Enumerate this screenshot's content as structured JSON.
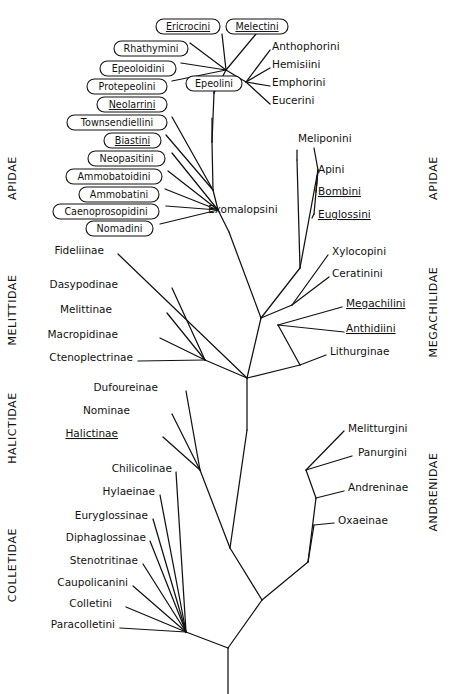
{
  "figure": {
    "type": "phylogenetic-cladogram",
    "background_color": "#ffffff",
    "line_color": "#111111"
  },
  "families": [
    {
      "id": "apidae",
      "label": "APIDAE",
      "side": "left",
      "x": 16,
      "y": 178,
      "rotate": -90
    },
    {
      "id": "apidae_right",
      "label": "APIDAE",
      "side": "right",
      "x": 437,
      "y": 178,
      "rotate": -90
    },
    {
      "id": "melittidae",
      "label": "MELITTIDAE",
      "side": "left",
      "x": 16,
      "y": 310,
      "rotate": -90
    },
    {
      "id": "megachilidae",
      "label": "MEGACHILIDAE",
      "side": "right",
      "x": 437,
      "y": 312,
      "rotate": -90
    },
    {
      "id": "halictidae",
      "label": "HALICTIDAE",
      "side": "left",
      "x": 16,
      "y": 428,
      "rotate": -90
    },
    {
      "id": "andrenidae",
      "label": "ANDRENIDAE",
      "side": "right",
      "x": 437,
      "y": 492,
      "rotate": -90
    },
    {
      "id": "colletidae",
      "label": "COLLETIDAE",
      "side": "left",
      "x": 16,
      "y": 565,
      "rotate": -90
    }
  ],
  "boxed_taxa": [
    {
      "id": "ericrocini",
      "label": "Ericrocini",
      "x": 156,
      "y": 19,
      "w": 64,
      "h": 15,
      "underlined": true,
      "anchor": "right"
    },
    {
      "id": "melectini",
      "label": "Melectini",
      "x": 226,
      "y": 19,
      "w": 62,
      "h": 15,
      "underlined": true,
      "anchor": "bottom"
    },
    {
      "id": "rhathymini",
      "label": "Rhathymini",
      "x": 114,
      "y": 41,
      "w": 74,
      "h": 15,
      "underlined": false,
      "anchor": "right"
    },
    {
      "id": "epeoloidini",
      "label": "Epeoloidini",
      "x": 100,
      "y": 61,
      "w": 76,
      "h": 15,
      "underlined": false,
      "anchor": "right"
    },
    {
      "id": "protepeolini",
      "label": "Protepeolini",
      "x": 87,
      "y": 79,
      "w": 80,
      "h": 15,
      "underlined": false,
      "anchor": "right"
    },
    {
      "id": "epeolini",
      "label": "Epeolini",
      "x": 186,
      "y": 76,
      "w": 56,
      "h": 15,
      "underlined": false,
      "anchor": "bottom"
    },
    {
      "id": "neolarrini",
      "label": "Neolarrini",
      "x": 97,
      "y": 97,
      "w": 70,
      "h": 15,
      "underlined": true,
      "anchor": "right"
    },
    {
      "id": "townsendiellini",
      "label": "Townsendiellini",
      "x": 67,
      "y": 115,
      "w": 100,
      "h": 15,
      "underlined": false,
      "anchor": "right"
    },
    {
      "id": "biastini",
      "label": "Biastini",
      "x": 104,
      "y": 133,
      "w": 57,
      "h": 15,
      "underlined": true,
      "anchor": "right"
    },
    {
      "id": "neopasitini",
      "label": "Neopasitini",
      "x": 88,
      "y": 151,
      "w": 77,
      "h": 15,
      "underlined": false,
      "anchor": "right"
    },
    {
      "id": "ammobatoidini",
      "label": "Ammobatoidini",
      "x": 66,
      "y": 169,
      "w": 96,
      "h": 15,
      "underlined": false,
      "anchor": "right"
    },
    {
      "id": "ammobatini",
      "label": "Ammobatini",
      "x": 79,
      "y": 187,
      "w": 80,
      "h": 15,
      "underlined": false,
      "anchor": "right"
    },
    {
      "id": "caenoprosopidini",
      "label": "Caenoprosopidini",
      "x": 53,
      "y": 204,
      "w": 106,
      "h": 15,
      "underlined": false,
      "anchor": "right"
    },
    {
      "id": "nomadini",
      "label": "Nomadini",
      "x": 86,
      "y": 221,
      "w": 67,
      "h": 15,
      "underlined": false,
      "anchor": "right"
    }
  ],
  "plain_taxa": [
    {
      "id": "anthophorini",
      "label": "Anthophorini",
      "x": 272,
      "y": 50,
      "underlined": false,
      "anchor": "start"
    },
    {
      "id": "hemisiini",
      "label": "Hemisiini",
      "x": 272,
      "y": 68,
      "underlined": false,
      "anchor": "start"
    },
    {
      "id": "emphorini",
      "label": "Emphorini",
      "x": 272,
      "y": 86,
      "underlined": false,
      "anchor": "start"
    },
    {
      "id": "eucerini",
      "label": "Eucerini",
      "x": 272,
      "y": 104,
      "underlined": false,
      "anchor": "start"
    },
    {
      "id": "meliponini",
      "label": "Meliponini",
      "x": 298,
      "y": 142,
      "underlined": false,
      "anchor": "start"
    },
    {
      "id": "apini",
      "label": "Apini",
      "x": 318,
      "y": 173,
      "underlined": false,
      "anchor": "start"
    },
    {
      "id": "bombini",
      "label": "Bombini",
      "x": 318,
      "y": 195,
      "underlined": true,
      "anchor": "start"
    },
    {
      "id": "euglossini",
      "label": "Euglossini",
      "x": 318,
      "y": 218,
      "underlined": true,
      "anchor": "start"
    },
    {
      "id": "exomalopsini",
      "label": "Exomalopsini",
      "x": 208,
      "y": 213,
      "underlined": false,
      "anchor": "start"
    },
    {
      "id": "xylocopini",
      "label": "Xylocopini",
      "x": 332,
      "y": 255,
      "underlined": false,
      "anchor": "start"
    },
    {
      "id": "ceratinini",
      "label": "Ceratinini",
      "x": 332,
      "y": 277,
      "underlined": false,
      "anchor": "start"
    },
    {
      "id": "megachilini",
      "label": "Megachilini",
      "x": 346,
      "y": 307,
      "underlined": true,
      "anchor": "start"
    },
    {
      "id": "anthidiini",
      "label": "Anthidiini",
      "x": 346,
      "y": 332,
      "underlined": true,
      "anchor": "start"
    },
    {
      "id": "lithurginae",
      "label": "Lithurginae",
      "x": 330,
      "y": 355,
      "underlined": false,
      "anchor": "start"
    },
    {
      "id": "fideliinae",
      "label": "Fideliinae",
      "x": 104,
      "y": 254,
      "underlined": false,
      "anchor": "end"
    },
    {
      "id": "dasypodinae",
      "label": "Dasypodinae",
      "x": 118,
      "y": 288,
      "underlined": false,
      "anchor": "end"
    },
    {
      "id": "melittinae",
      "label": "Melittinae",
      "x": 112,
      "y": 313,
      "underlined": false,
      "anchor": "end"
    },
    {
      "id": "macropidinae",
      "label": "Macropidinae",
      "x": 118,
      "y": 338,
      "underlined": false,
      "anchor": "end"
    },
    {
      "id": "ctenoplectrinae",
      "label": "Ctenoplectrinae",
      "x": 133,
      "y": 361,
      "underlined": false,
      "anchor": "end"
    },
    {
      "id": "dufoureinae",
      "label": "Dufoureinae",
      "x": 158,
      "y": 391,
      "underlined": false,
      "anchor": "end"
    },
    {
      "id": "nominae",
      "label": "Nominae",
      "x": 130,
      "y": 414,
      "underlined": false,
      "anchor": "end"
    },
    {
      "id": "halictinae",
      "label": "Halictinae",
      "x": 118,
      "y": 437,
      "underlined": true,
      "anchor": "end"
    },
    {
      "id": "chilicolinae",
      "label": "Chilicolinae",
      "x": 172,
      "y": 472,
      "underlined": false,
      "anchor": "end"
    },
    {
      "id": "hylaeinae",
      "label": "Hylaeinae",
      "x": 155,
      "y": 495,
      "underlined": false,
      "anchor": "end"
    },
    {
      "id": "euryglossinae",
      "label": "Euryglossinae",
      "x": 148,
      "y": 519,
      "underlined": false,
      "anchor": "end"
    },
    {
      "id": "diphaglossinae",
      "label": "Diphaglossinae",
      "x": 146,
      "y": 541,
      "underlined": false,
      "anchor": "end"
    },
    {
      "id": "stenotritinae",
      "label": "Stenotritinae",
      "x": 138,
      "y": 564,
      "underlined": false,
      "anchor": "end"
    },
    {
      "id": "caupolicanini",
      "label": "Caupolicanini",
      "x": 128,
      "y": 586,
      "underlined": false,
      "anchor": "end"
    },
    {
      "id": "colletini",
      "label": "Colletini",
      "x": 112,
      "y": 607,
      "underlined": false,
      "anchor": "end"
    },
    {
      "id": "paracolletini",
      "label": "Paracolletini",
      "x": 115,
      "y": 628,
      "underlined": false,
      "anchor": "end"
    },
    {
      "id": "melitturgini",
      "label": "Melitturgini",
      "x": 348,
      "y": 432,
      "underlined": false,
      "anchor": "start"
    },
    {
      "id": "panurgini",
      "label": "Panurgini",
      "x": 358,
      "y": 456,
      "underlined": false,
      "anchor": "start"
    },
    {
      "id": "andreninae",
      "label": "Andreninae",
      "x": 348,
      "y": 491,
      "underlined": false,
      "anchor": "start"
    },
    {
      "id": "oxaeinae",
      "label": "Oxaeinae",
      "x": 338,
      "y": 524,
      "underlined": false,
      "anchor": "start"
    }
  ],
  "branches": [
    "M228,694 L228,648",
    "M228,648 L186,632",
    "M228,648 L262,600",
    "M186,632 L120,628",
    "M186,632 L126,607",
    "M186,632 L133,586",
    "M186,632 L143,564",
    "M186,632 L150,541",
    "M186,632 L153,519",
    "M186,632 L160,495",
    "M186,632 L176,472",
    "M262,600 L308,562",
    "M262,600 L230,548",
    "M308,562 L314,525",
    "M308,562 L316,498",
    "M314,525 L334,523",
    "M316,498 L344,491",
    "M316,498 L306,470",
    "M306,470 L344,431",
    "M306,470 L352,456",
    "M230,548 L200,470",
    "M200,470 L163,437",
    "M200,470 L172,414",
    "M200,470 L186,391",
    "M230,548 L247,430",
    "M247,430 L247,378",
    "M247,378 L205,360",
    "M247,378 L261,318",
    "M205,360 L138,361",
    "M205,360 L160,338",
    "M205,360 L167,313",
    "M205,360 L172,288",
    "M247,378 L300,365",
    "M300,365 L326,355",
    "M300,365 L278,325",
    "M278,325 L344,332",
    "M278,325 L342,307",
    "M247,378 L118,254",
    "M261,318 L229,232",
    "M261,318 L292,305",
    "M292,305 L329,277",
    "M292,305 L328,255",
    "M261,318 L300,268",
    "M300,268 L318,170",
    "M318,170 L314,214",
    "M318,170 L314,148",
    "M318,170 L316,192",
    "M314,214 L312,218",
    "M229,232 L218,210",
    "M218,210 L213,190",
    "M218,210 L160,224",
    "M218,210 L166,206",
    "M218,210 L165,189",
    "M218,210 L168,171",
    "M218,210 L172,153",
    "M213,190 L166,135",
    "M213,190 L172,117",
    "M213,190 L212,142",
    "M212,142 L214,93",
    "M214,93 L214,83",
    "M214,93 L226,70",
    "M226,70 L172,81",
    "M226,70 L181,63",
    "M226,70 L190,43",
    "M226,70 L222,34",
    "M226,70 L256,34",
    "M226,70 L246,82",
    "M246,82 L270,50",
    "M246,82 L270,68",
    "M246,82 L270,86",
    "M246,82 L270,104",
    "M212,142 L212,118",
    "M300,268 L297,160",
    "M297,160 L297,150"
  ]
}
